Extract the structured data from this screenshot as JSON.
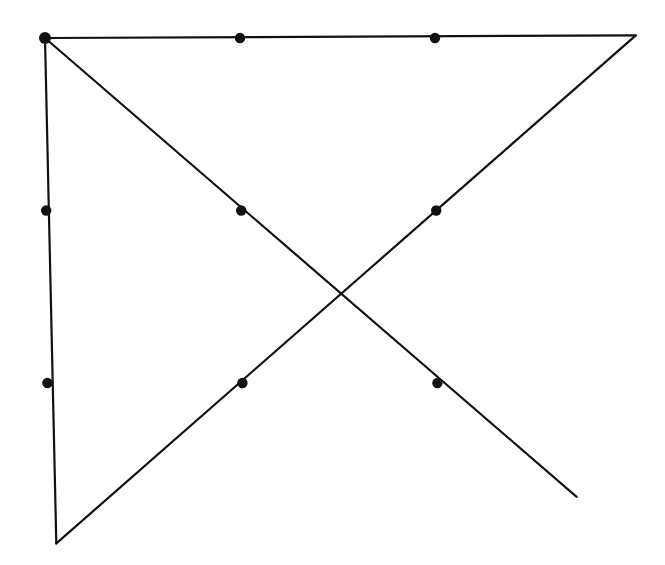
{
  "diagram": {
    "stroke_color": "#111111",
    "dot_color": "#111111",
    "background": "#ffffff",
    "grid": {
      "rows": 3,
      "cols": 3
    },
    "dots": [
      {
        "row": 0,
        "col": 0
      },
      {
        "row": 0,
        "col": 1
      },
      {
        "row": 0,
        "col": 2
      },
      {
        "row": 1,
        "col": 0
      },
      {
        "row": 1,
        "col": 1
      },
      {
        "row": 1,
        "col": 2
      },
      {
        "row": 2,
        "col": 0
      },
      {
        "row": 2,
        "col": 1
      },
      {
        "row": 2,
        "col": 2
      }
    ],
    "lines": [
      {
        "name": "top-horizontal-line",
        "from": [
          0,
          0
        ],
        "to": [
          3.03,
          -0.015
        ]
      },
      {
        "name": "long-diagonal-line",
        "from": [
          3.03,
          -0.015
        ],
        "to": [
          0.04,
          2.93
        ]
      },
      {
        "name": "left-vertical-line",
        "from": [
          0,
          0
        ],
        "to": [
          0.04,
          2.93
        ]
      },
      {
        "name": "descending-diagonal-line",
        "from": [
          0,
          0
        ],
        "to": [
          2.71,
          2.66
        ]
      }
    ]
  }
}
